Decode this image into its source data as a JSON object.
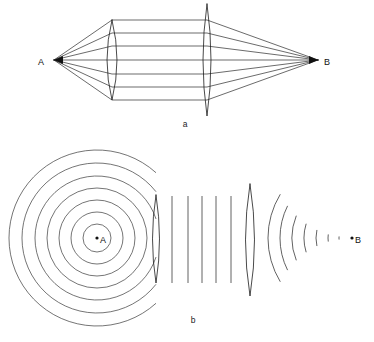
{
  "figure": {
    "background_color": "#ffffff",
    "line_color": "#2b2b2b",
    "width": 374,
    "height": 342
  },
  "panel_a": {
    "label": "a",
    "label_x": 185,
    "label_y": 127,
    "description": "Ray diagram: rays diverge from point A, are collimated by the first lens, travel parallel, then are focused by the second lens to point B",
    "source_point": {
      "name": "A",
      "label": "A",
      "x": 54,
      "y": 60,
      "label_x": 44,
      "label_y": 63
    },
    "image_point": {
      "name": "B",
      "label": "B",
      "x": 318,
      "y": 60,
      "label_x": 324,
      "label_y": 63
    },
    "lens_1": {
      "name": "collimating-lens",
      "center_x": 112,
      "center_y": 60,
      "half_height": 40,
      "bulge": 10
    },
    "lens_2": {
      "name": "focusing-lens",
      "center_x": 207,
      "center_y": 60,
      "half_height": 56,
      "bulge": 8
    },
    "ray_offsets": [
      -40,
      -27,
      -14,
      0,
      14,
      27,
      40
    ],
    "ray_count": 7
  },
  "panel_b": {
    "label": "b",
    "label_x": 193,
    "label_y": 323,
    "description": "Wavefront diagram: spherical wavefronts expand from A, become plane waves after the first lens, then converge as spherical wavefronts to B",
    "source_point": {
      "name": "A",
      "label": "A",
      "x": 97,
      "y": 238,
      "label_x": 100,
      "label_y": 241
    },
    "image_point": {
      "name": "B",
      "label": "B",
      "x": 352,
      "y": 238,
      "label_x": 355,
      "label_y": 241
    },
    "spherical_wave_radii": [
      14,
      26,
      38,
      50,
      62,
      75,
      88
    ],
    "spherical_wave_count": 7,
    "lens_1": {
      "name": "collimating-lens",
      "center_x": 156,
      "center_y": 239,
      "half_height": 44,
      "bulge": 7
    },
    "lens_2": {
      "name": "focusing-lens",
      "center_x": 250,
      "center_y": 240,
      "half_height": 56,
      "bulge": 9
    },
    "plane_wave_x": [
      172,
      188,
      202,
      216,
      231
    ],
    "plane_wave_count": 5,
    "plane_wave_top": 196,
    "plane_wave_bottom": 283,
    "converging_wave_radii": [
      84,
      72,
      60,
      48,
      36,
      24,
      13
    ],
    "converging_wave_count": 7
  }
}
